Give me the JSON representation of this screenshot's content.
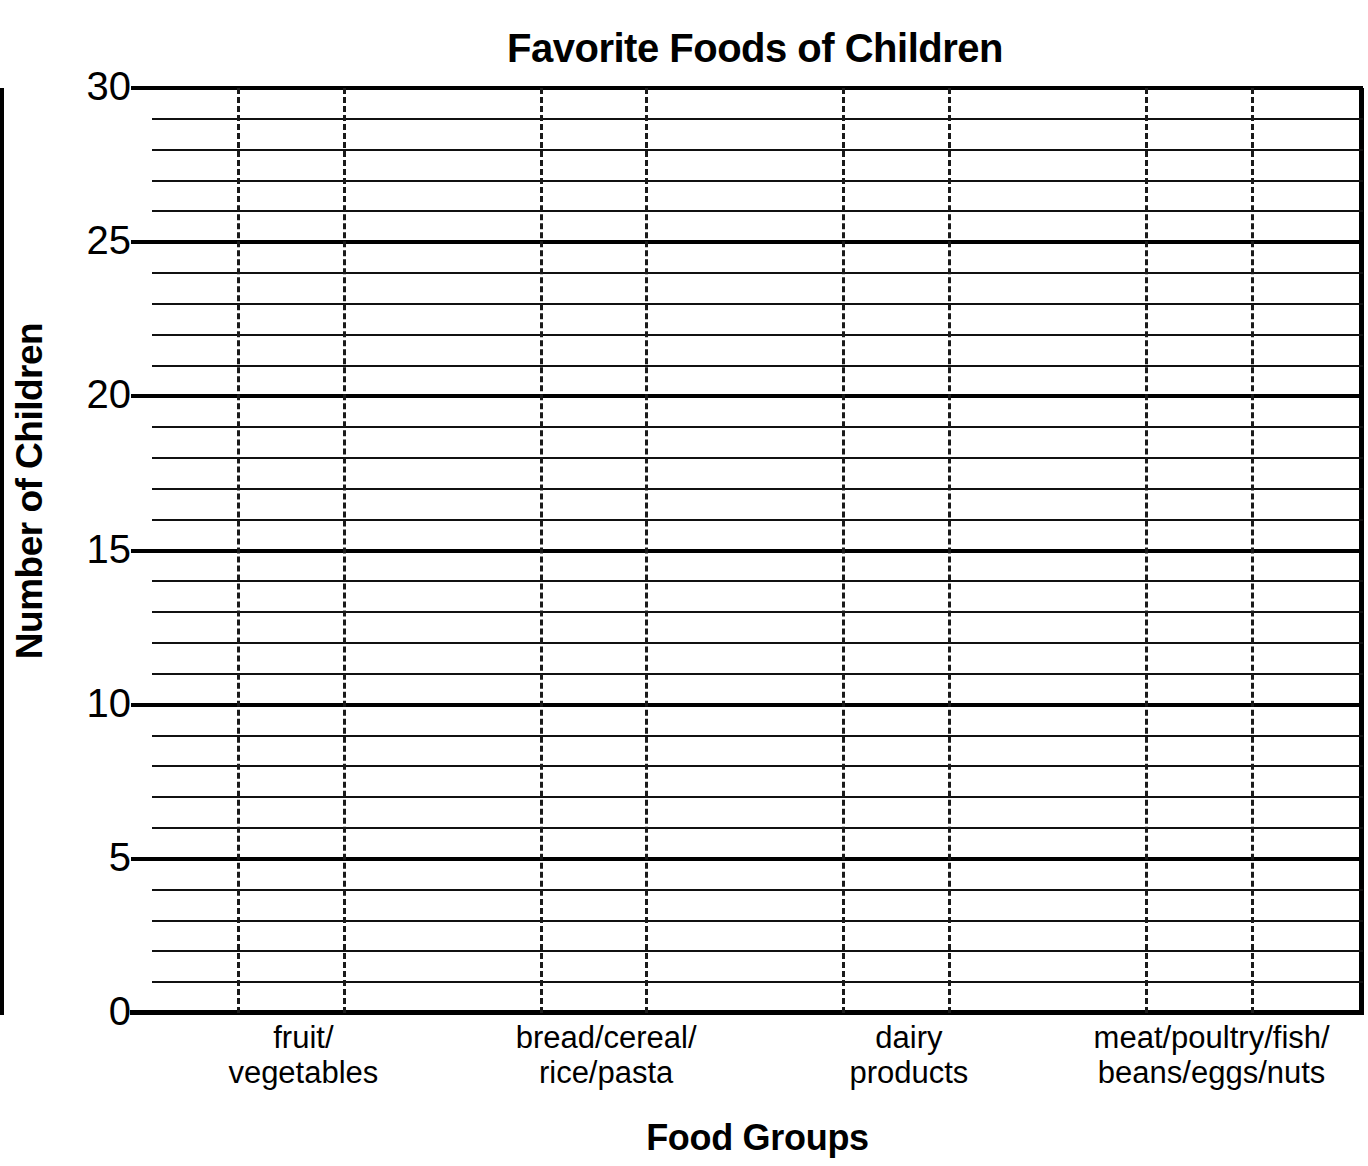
{
  "chart_data": {
    "type": "bar",
    "title": "Favorite Foods of Children",
    "xlabel": "Food Groups",
    "ylabel": "Number of Children",
    "categories": [
      "fruit/\nvegetables",
      "bread/cereal/\nrice/pasta",
      "dairy\nproducts",
      "meat/poultry/fish/\nbeans/eggs/nuts"
    ],
    "values": [
      null,
      null,
      null,
      null
    ],
    "series": [
      {
        "name": "Number of Children",
        "values": [
          null,
          null,
          null,
          null
        ]
      }
    ],
    "ylim": [
      0,
      30
    ],
    "ytick_major_labels": [
      "0",
      "5",
      "10",
      "15",
      "20",
      "25",
      "30"
    ],
    "ytick_major_values": [
      0,
      5,
      10,
      15,
      20,
      25,
      30
    ],
    "ytick_minor_step": 1,
    "grid": "horizontal-solid-minor-and-major; vertical-dashed-category-boundaries",
    "legend": "none",
    "note": "blank grid template, no bars drawn",
    "colors": {
      "background": "#ffffff",
      "ink": "#000000",
      "gridline_minor": "#111111",
      "gridline_major": "#000000",
      "gridline_vertical": "#1a1a1a"
    }
  },
  "axis": {
    "y_ticks": [
      {
        "label": "30",
        "value": 30,
        "major": true
      },
      {
        "label": "25",
        "value": 25,
        "major": true
      },
      {
        "label": "20",
        "value": 20,
        "major": true
      },
      {
        "label": "15",
        "value": 15,
        "major": true
      },
      {
        "label": "10",
        "value": 10,
        "major": true
      },
      {
        "label": "5",
        "value": 5,
        "major": true
      },
      {
        "label": "0",
        "value": 0,
        "major": true
      }
    ],
    "x_ticks": [
      {
        "label": "fruit/\nvegetables"
      },
      {
        "label": "bread/cereal/\nrice/pasta"
      },
      {
        "label": "dairy\nproducts"
      },
      {
        "label": "meat/poultry/fish/\nbeans/eggs/nuts"
      }
    ]
  }
}
